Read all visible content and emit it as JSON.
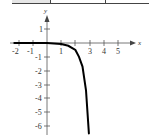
{
  "chart_data": {
    "type": "line",
    "title": "",
    "xlabel": "x",
    "ylabel": "y",
    "xlim": [
      -2.3,
      5.8
    ],
    "ylim": [
      -6.6,
      1.9
    ],
    "x_ticks": [
      -2,
      -1,
      1,
      2,
      3,
      4,
      5
    ],
    "x_tick_labels": [
      "-2",
      "-1",
      "1",
      "3",
      "4",
      "5"
    ],
    "y_ticks": [
      1,
      -1,
      -2,
      -3,
      -4,
      -5,
      -6
    ],
    "y_tick_labels": [
      "1",
      "-1",
      "-2",
      "-3",
      "-4",
      "-5",
      "-6"
    ],
    "grid": false,
    "legend": null,
    "series": [
      {
        "name": "curve",
        "color": "#000000",
        "x": [
          -2.3,
          -1,
          0,
          0.5,
          1,
          1.5,
          2,
          2.25,
          2.5,
          2.75,
          2.95
        ],
        "y": [
          0,
          0,
          -0.01,
          -0.03,
          -0.08,
          -0.2,
          -0.5,
          -1.0,
          -1.7,
          -3.4,
          -6.5
        ]
      }
    ]
  },
  "labels": {
    "x_axis": "x",
    "y_axis": "y",
    "xt": [
      "-2",
      "-1",
      "1",
      "3",
      "4",
      "5"
    ],
    "yt": [
      "1",
      "-1",
      "-2",
      "-3",
      "-4",
      "-5",
      "-6"
    ]
  }
}
